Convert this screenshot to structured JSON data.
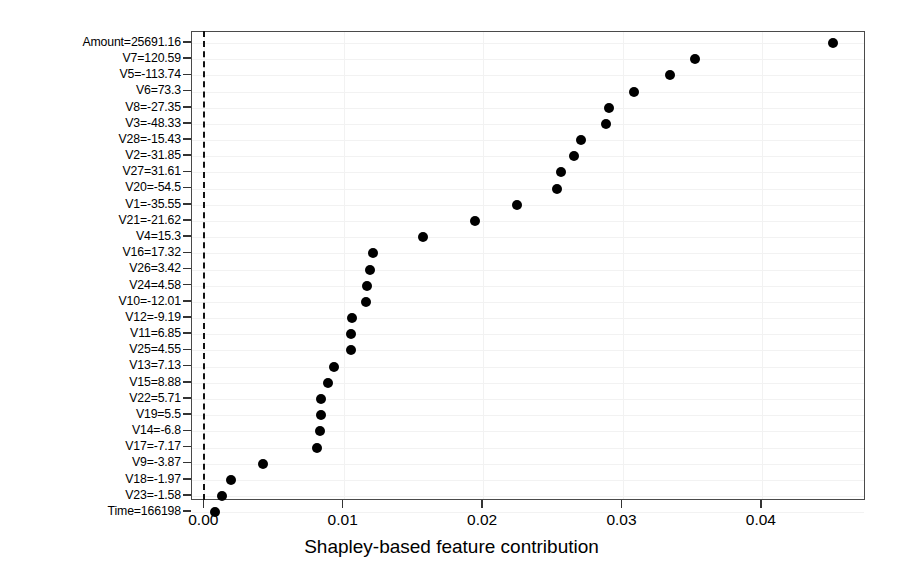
{
  "chart_data": {
    "type": "scatter",
    "title": "",
    "xlabel": "Shapley-based feature contribution",
    "ylabel": "",
    "xlim": [
      -0.0012,
      0.0474
    ],
    "xticks": [
      0.0,
      0.01,
      0.02,
      0.03,
      0.04
    ],
    "xticklabels": [
      "0.00",
      "0.01",
      "0.02",
      "0.03",
      "0.04"
    ],
    "grid": true,
    "legend": null,
    "reference_line": {
      "x": 0.0,
      "style": "dashed",
      "color": "#111111"
    },
    "marker": {
      "shape": "circle",
      "color": "#000000",
      "size": 10
    },
    "categories": [
      "Amount=25691.16",
      "V7=120.59",
      "V5=-113.74",
      "V6=73.3",
      "V8=-27.35",
      "V3=-48.33",
      "V28=-15.43",
      "V2=-31.85",
      "V27=31.61",
      "V20=-54.5",
      "V1=-35.55",
      "V21=-21.62",
      "V4=15.3",
      "V16=17.32",
      "V26=3.42",
      "V24=4.58",
      "V10=-12.01",
      "V12=-9.19",
      "V11=6.85",
      "V25=4.55",
      "V13=7.13",
      "V15=8.88",
      "V22=5.71",
      "V19=5.5",
      "V14=-6.8",
      "V17=-7.17",
      "V9=-3.87",
      "V18=-1.97",
      "V23=-1.58",
      "Time=166198"
    ],
    "values": [
      0.0451,
      0.0352,
      0.0334,
      0.0308,
      0.029,
      0.0288,
      0.027,
      0.0265,
      0.0256,
      0.0253,
      0.0224,
      0.0194,
      0.0157,
      0.0121,
      0.0119,
      0.0117,
      0.0116,
      0.0106,
      0.0105,
      0.0105,
      0.0093,
      0.0089,
      0.0084,
      0.0084,
      0.0083,
      0.0081,
      0.0042,
      0.0019,
      0.0013,
      0.0008
    ]
  }
}
